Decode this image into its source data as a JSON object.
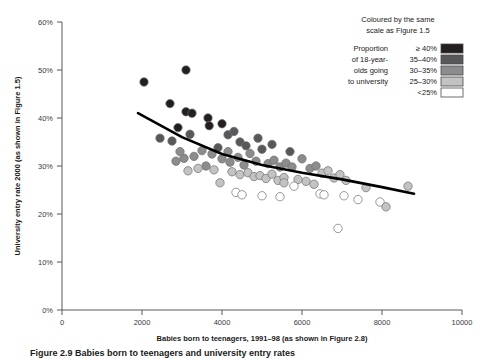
{
  "chart_data": {
    "type": "scatter",
    "title": "",
    "xlabel": "Babies born to teenagers, 1991–98 (as shown in Figure 2.8)",
    "ylabel": "University entry rate 2000 (as shown in Figure 1.5)",
    "xlim": [
      0,
      10000
    ],
    "ylim": [
      0,
      60
    ],
    "xticks": [
      0,
      2000,
      4000,
      6000,
      8000,
      10000
    ],
    "xtick_labels": [
      "0",
      "2000",
      "4000",
      "6000",
      "8000",
      "10000"
    ],
    "yticks": [
      0,
      10,
      20,
      30,
      40,
      50,
      60
    ],
    "ytick_labels": [
      "0%",
      "10%",
      "20%",
      "30%",
      "40%",
      "50%",
      "60%"
    ],
    "grid": false,
    "legend_position": "top-right",
    "y_unit": "percent",
    "point_color_meaning": "Proportion of 18-year-olds going to university",
    "points": [
      {
        "x": 2050,
        "y": 47.5,
        "band": "ge40"
      },
      {
        "x": 3100,
        "y": 50.0,
        "band": "ge40"
      },
      {
        "x": 2700,
        "y": 43.0,
        "band": "ge40"
      },
      {
        "x": 3100,
        "y": 41.3,
        "band": "ge40"
      },
      {
        "x": 3250,
        "y": 41.0,
        "band": "ge40"
      },
      {
        "x": 3650,
        "y": 40.0,
        "band": "ge40"
      },
      {
        "x": 3680,
        "y": 38.4,
        "band": "ge40"
      },
      {
        "x": 2900,
        "y": 38.0,
        "band": "ge40"
      },
      {
        "x": 3200,
        "y": 36.6,
        "band": "3540"
      },
      {
        "x": 2450,
        "y": 35.8,
        "band": "3540"
      },
      {
        "x": 2750,
        "y": 35.2,
        "band": "3540"
      },
      {
        "x": 4000,
        "y": 38.8,
        "band": "ge40"
      },
      {
        "x": 4150,
        "y": 36.5,
        "band": "3540"
      },
      {
        "x": 4300,
        "y": 37.2,
        "band": "3540"
      },
      {
        "x": 4450,
        "y": 35.0,
        "band": "3540"
      },
      {
        "x": 4600,
        "y": 34.2,
        "band": "3540"
      },
      {
        "x": 3900,
        "y": 33.8,
        "band": "3540"
      },
      {
        "x": 3750,
        "y": 32.5,
        "band": "3035"
      },
      {
        "x": 3500,
        "y": 33.2,
        "band": "3035"
      },
      {
        "x": 3300,
        "y": 32.0,
        "band": "3035"
      },
      {
        "x": 3050,
        "y": 31.6,
        "band": "3035"
      },
      {
        "x": 2850,
        "y": 31.0,
        "band": "3035"
      },
      {
        "x": 4000,
        "y": 31.5,
        "band": "3035"
      },
      {
        "x": 4200,
        "y": 30.8,
        "band": "3035"
      },
      {
        "x": 4400,
        "y": 31.8,
        "band": "3035"
      },
      {
        "x": 4550,
        "y": 30.2,
        "band": "3035"
      },
      {
        "x": 4700,
        "y": 32.6,
        "band": "3035"
      },
      {
        "x": 4850,
        "y": 31.0,
        "band": "3035"
      },
      {
        "x": 5000,
        "y": 33.5,
        "band": "3540"
      },
      {
        "x": 5150,
        "y": 30.5,
        "band": "3035"
      },
      {
        "x": 5300,
        "y": 31.2,
        "band": "3035"
      },
      {
        "x": 5450,
        "y": 29.8,
        "band": "3035"
      },
      {
        "x": 5600,
        "y": 30.6,
        "band": "3035"
      },
      {
        "x": 4250,
        "y": 28.8,
        "band": "2530"
      },
      {
        "x": 4450,
        "y": 28.2,
        "band": "2530"
      },
      {
        "x": 4650,
        "y": 28.6,
        "band": "2530"
      },
      {
        "x": 4800,
        "y": 27.8,
        "band": "2530"
      },
      {
        "x": 4950,
        "y": 28.0,
        "band": "2530"
      },
      {
        "x": 5100,
        "y": 27.4,
        "band": "2530"
      },
      {
        "x": 5250,
        "y": 28.3,
        "band": "2530"
      },
      {
        "x": 5400,
        "y": 27.0,
        "band": "2530"
      },
      {
        "x": 5550,
        "y": 27.6,
        "band": "2530"
      },
      {
        "x": 4350,
        "y": 24.5,
        "band": "lt25"
      },
      {
        "x": 4500,
        "y": 24.0,
        "band": "lt25"
      },
      {
        "x": 5000,
        "y": 23.8,
        "band": "lt25"
      },
      {
        "x": 5450,
        "y": 23.6,
        "band": "lt25"
      },
      {
        "x": 3950,
        "y": 26.5,
        "band": "2530"
      },
      {
        "x": 3800,
        "y": 29.2,
        "band": "2530"
      },
      {
        "x": 6000,
        "y": 31.5,
        "band": "3035"
      },
      {
        "x": 6200,
        "y": 29.5,
        "band": "3035"
      },
      {
        "x": 6350,
        "y": 30.0,
        "band": "3035"
      },
      {
        "x": 6500,
        "y": 28.5,
        "band": "2530"
      },
      {
        "x": 6650,
        "y": 29.0,
        "band": "2530"
      },
      {
        "x": 6800,
        "y": 27.5,
        "band": "2530"
      },
      {
        "x": 6950,
        "y": 28.2,
        "band": "2530"
      },
      {
        "x": 7100,
        "y": 27.0,
        "band": "2530"
      },
      {
        "x": 6100,
        "y": 26.8,
        "band": "2530"
      },
      {
        "x": 6300,
        "y": 26.2,
        "band": "2530"
      },
      {
        "x": 5900,
        "y": 27.2,
        "band": "2530"
      },
      {
        "x": 5800,
        "y": 25.8,
        "band": "lt25"
      },
      {
        "x": 6450,
        "y": 24.2,
        "band": "lt25"
      },
      {
        "x": 6550,
        "y": 24.0,
        "band": "lt25"
      },
      {
        "x": 7050,
        "y": 23.8,
        "band": "lt25"
      },
      {
        "x": 7400,
        "y": 23.0,
        "band": "lt25"
      },
      {
        "x": 6900,
        "y": 17.0,
        "band": "lt25"
      },
      {
        "x": 7600,
        "y": 25.5,
        "band": "2530"
      },
      {
        "x": 7950,
        "y": 22.5,
        "band": "lt25"
      },
      {
        "x": 8100,
        "y": 21.5,
        "band": "2530"
      },
      {
        "x": 8650,
        "y": 25.8,
        "band": "2530"
      },
      {
        "x": 5700,
        "y": 33.0,
        "band": "3540"
      },
      {
        "x": 5250,
        "y": 34.5,
        "band": "3540"
      },
      {
        "x": 4900,
        "y": 35.8,
        "band": "3540"
      },
      {
        "x": 4150,
        "y": 33.0,
        "band": "3035"
      },
      {
        "x": 3600,
        "y": 30.0,
        "band": "3035"
      },
      {
        "x": 3400,
        "y": 29.5,
        "band": "2530"
      },
      {
        "x": 3150,
        "y": 29.0,
        "band": "2530"
      },
      {
        "x": 2950,
        "y": 33.0,
        "band": "3035"
      },
      {
        "x": 5550,
        "y": 26.5,
        "band": "2530"
      },
      {
        "x": 5750,
        "y": 29.8,
        "band": "3035"
      }
    ],
    "trend_line": {
      "description": "fitted decreasing curve",
      "points": [
        {
          "x": 1900,
          "y": 41.0
        },
        {
          "x": 3000,
          "y": 36.0
        },
        {
          "x": 4000,
          "y": 32.5
        },
        {
          "x": 5000,
          "y": 30.2
        },
        {
          "x": 6000,
          "y": 28.6
        },
        {
          "x": 7000,
          "y": 27.2
        },
        {
          "x": 8000,
          "y": 25.6
        },
        {
          "x": 8800,
          "y": 24.2
        }
      ]
    }
  },
  "legend": {
    "header_line1": "Coloured by the same",
    "header_line2": "scale as Figure 1.5",
    "title_lines": [
      "Proportion",
      "of 18-year-",
      "olds going",
      "to university"
    ],
    "entries": [
      {
        "label": "≥ 40%",
        "color": "#231f20",
        "band": "ge40"
      },
      {
        "label": "35–40%",
        "color": "#58585a",
        "band": "3540"
      },
      {
        "label": "30–35%",
        "color": "#8c8c8e",
        "band": "3035"
      },
      {
        "label": "25–30%",
        "color": "#c3c3c4",
        "band": "2530"
      },
      {
        "label": "<25%",
        "color": "#ffffff",
        "band": "lt25"
      }
    ]
  },
  "caption": {
    "text": "Figure 2.9   Babies born to teenagers and university entry rates"
  }
}
